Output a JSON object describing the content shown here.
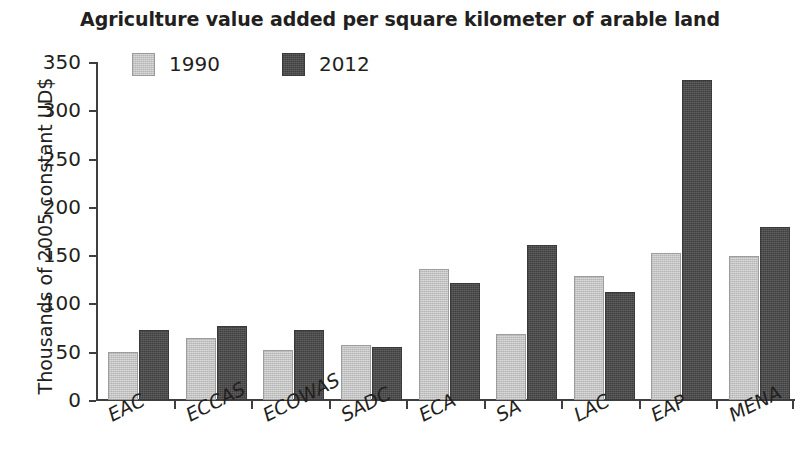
{
  "chart_data": {
    "type": "bar",
    "title": "Agriculture value added per square kilometer of arable land",
    "xlabel": "",
    "ylabel": "Thousands of 2005 constant UD$",
    "categories": [
      "EAC",
      "ECCAS",
      "ECOWAS",
      "SADC",
      "ECA",
      "SA",
      "LAC",
      "EAP",
      "MENA"
    ],
    "series": [
      {
        "name": "1990",
        "color": "#c3c3c3",
        "values": [
          50,
          64,
          52,
          57,
          136,
          68,
          128,
          152,
          149
        ]
      },
      {
        "name": "2012",
        "color": "#4d4d4d",
        "values": [
          72,
          77,
          73,
          55,
          121,
          161,
          112,
          331,
          179
        ]
      }
    ],
    "ylim": [
      0,
      350
    ],
    "yticks": [
      0,
      50,
      100,
      150,
      200,
      250,
      300,
      350
    ],
    "ytick_labels": [
      "0",
      "50",
      "100",
      "150",
      "200",
      "250",
      "300",
      "350"
    ],
    "grid": false,
    "legend_position": "top-left"
  },
  "legend": {
    "items": [
      {
        "label": "1990"
      },
      {
        "label": "2012"
      }
    ]
  }
}
